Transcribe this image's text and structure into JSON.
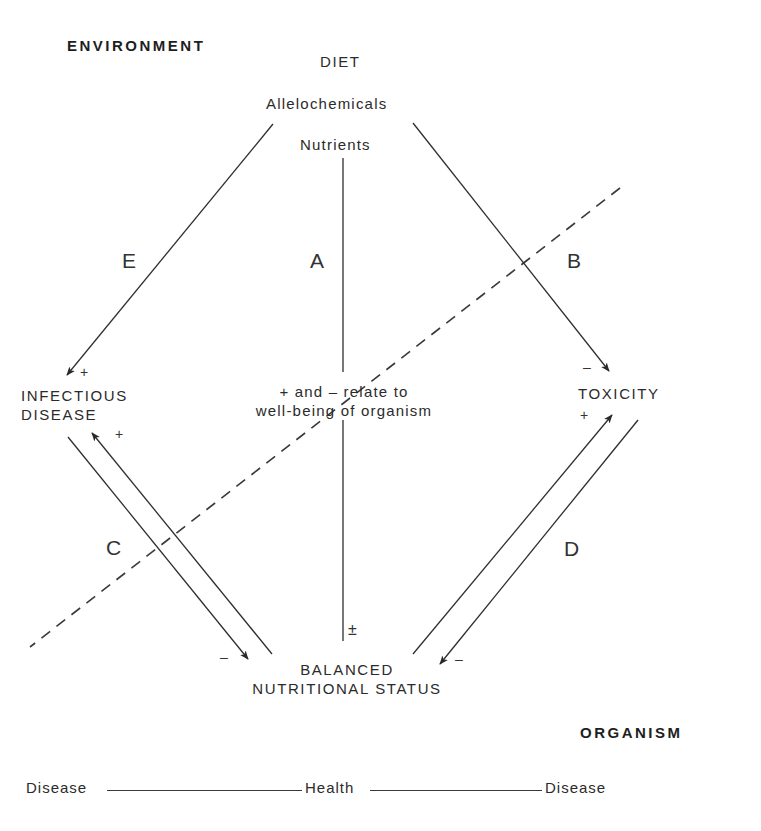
{
  "diagram": {
    "regions": {
      "environment": "ENVIRONMENT",
      "organism": "ORGANISM"
    },
    "diet": {
      "title": "DIET",
      "allelochemicals": "Allelochemicals",
      "nutrients": "Nutrients"
    },
    "nodes": {
      "infectious_disease_line1": "INFECTIOUS",
      "infectious_disease_line2": "DISEASE",
      "toxicity": "TOXICITY",
      "balanced_line1": "BALANCED",
      "balanced_line2": "NUTRITIONAL STATUS",
      "center_note_line1": "+ and – relate to",
      "center_note_line2": "well-being of organism"
    },
    "pathways": {
      "A": "A",
      "B": "B",
      "C": "C",
      "D": "D",
      "E": "E"
    },
    "signs": {
      "infectious_top": "+",
      "infectious_bottom": "+",
      "toxicity_top": "–",
      "toxicity_bottom": "+",
      "balanced_left": "–",
      "balanced_right": "–",
      "balanced_center": "±"
    },
    "edges": [
      {
        "id": "E",
        "from": "Allelochemicals",
        "to": "INFECTIOUS DISEASE",
        "sign": "+"
      },
      {
        "id": "A",
        "from": "Nutrients",
        "to": "BALANCED NUTRITIONAL STATUS",
        "sign": "±"
      },
      {
        "id": "B",
        "from": "Allelochemicals",
        "to": "TOXICITY",
        "sign": "–"
      },
      {
        "id": "C-down",
        "from": "INFECTIOUS DISEASE",
        "to": "BALANCED NUTRITIONAL STATUS",
        "sign": "–"
      },
      {
        "id": "C-up",
        "from": "BALANCED NUTRITIONAL STATUS",
        "to": "INFECTIOUS DISEASE",
        "sign": "+"
      },
      {
        "id": "D-up",
        "from": "BALANCED NUTRITIONAL STATUS",
        "to": "TOXICITY",
        "sign": "+"
      },
      {
        "id": "D-down",
        "from": "TOXICITY",
        "to": "BALANCED NUTRITIONAL STATUS",
        "sign": "–"
      }
    ],
    "boundary": "dashed line separating environment and organism",
    "scale": {
      "left": "Disease",
      "middle": "Health",
      "right": "Disease"
    },
    "colors": {
      "line": "#2e2e2e",
      "text": "#2b2b2b",
      "background": "#ffffff"
    }
  }
}
